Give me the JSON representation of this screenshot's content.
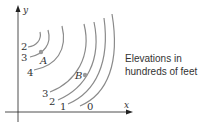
{
  "figure": {
    "axes": {
      "x_label": "x",
      "y_label": "y"
    },
    "caption_line1": "Elevations in",
    "caption_line2": "hundreds of feet",
    "points": [
      {
        "label": "A"
      },
      {
        "label": "B"
      }
    ],
    "upper_contour_labels": [
      "2",
      "3",
      "4"
    ],
    "lower_contour_labels": [
      "3",
      "2",
      "1",
      "0"
    ],
    "colors": {
      "contour": "#8a8a8a",
      "point": "#9a9a9a",
      "axis": "#222222"
    }
  }
}
